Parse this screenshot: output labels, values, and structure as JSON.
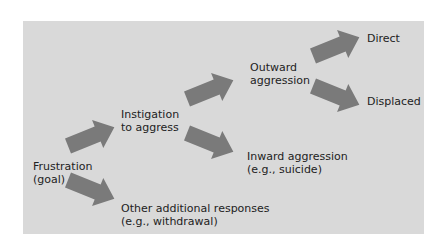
{
  "colors": {
    "panel": "#d9d9d9",
    "arrow": "#7a7a7a",
    "text": "#222222"
  },
  "nodes": {
    "frustration": {
      "line1": "Frustration",
      "line2": "(goal)"
    },
    "instigation": {
      "line1": "Instigation",
      "line2": "to aggress"
    },
    "other": {
      "line1": "Other additional responses",
      "line2": "(e.g., withdrawal)"
    },
    "outward": {
      "line1": "Outward",
      "line2": "aggression"
    },
    "inward": {
      "line1": "Inward aggression",
      "line2": "(e.g., suicide)"
    },
    "direct": {
      "line1": "Direct"
    },
    "displaced": {
      "line1": "Displaced"
    }
  },
  "edges": [
    {
      "from": "frustration",
      "to": "instigation"
    },
    {
      "from": "frustration",
      "to": "other"
    },
    {
      "from": "instigation",
      "to": "outward"
    },
    {
      "from": "instigation",
      "to": "inward"
    },
    {
      "from": "outward",
      "to": "direct"
    },
    {
      "from": "outward",
      "to": "displaced"
    }
  ]
}
